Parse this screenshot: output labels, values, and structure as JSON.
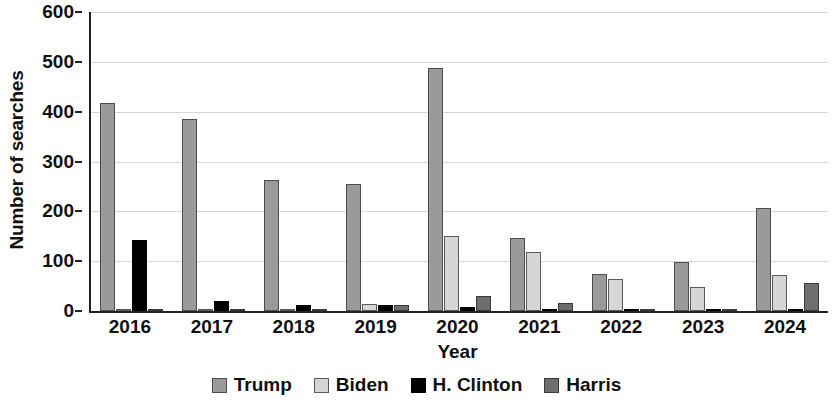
{
  "chart_data": {
    "type": "bar",
    "title": "",
    "xlabel": "Year",
    "ylabel": "Number of searches",
    "categories": [
      "2016",
      "2017",
      "2018",
      "2019",
      "2020",
      "2021",
      "2022",
      "2023",
      "2024"
    ],
    "series": [
      {
        "name": "Trump",
        "color": "#9a9a9a",
        "values": [
          418,
          385,
          263,
          255,
          487,
          147,
          75,
          98,
          207
        ]
      },
      {
        "name": "Biden",
        "color": "#d6d6d6",
        "values": [
          5,
          4,
          2,
          15,
          150,
          118,
          65,
          48,
          72
        ]
      },
      {
        "name": "H. Clinton",
        "color": "#000000",
        "values": [
          143,
          20,
          12,
          12,
          8,
          0,
          0,
          0,
          3
        ]
      },
      {
        "name": "Harris",
        "color": "#6e6e6e",
        "values": [
          0,
          0,
          0,
          12,
          30,
          17,
          5,
          0,
          57
        ]
      }
    ],
    "ylim": [
      0,
      600
    ],
    "yticks": [
      0,
      100,
      200,
      300,
      400,
      500,
      600
    ],
    "grid": true,
    "legend_position": "bottom"
  }
}
